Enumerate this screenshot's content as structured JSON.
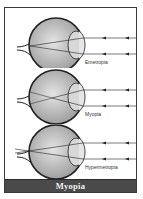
{
  "figure": {
    "caption": "Myopia",
    "colors": {
      "caption_bg": "#4a4a4a",
      "caption_text": "#f2f2f2",
      "eye_fill": "#bdbdbd",
      "outline": "#222222"
    },
    "panels": [
      {
        "label": "Emetropia",
        "focus": "on-retina"
      },
      {
        "label": "Myopia",
        "focus": "in-front-of-retina"
      },
      {
        "label": "Hypermetropia",
        "focus": "behind-retina"
      }
    ]
  }
}
